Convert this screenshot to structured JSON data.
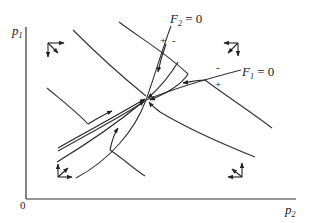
{
  "diagram": {
    "type": "phase-diagram",
    "axes": {
      "x_label": "p",
      "x_subscript": "2",
      "y_label": "p",
      "y_subscript": "1",
      "origin_label": "0"
    },
    "loci": [
      {
        "name": "F",
        "subscript": "2",
        "eq": " = 0",
        "plus": "+",
        "minus": "-"
      },
      {
        "name": "F",
        "subscript": "1",
        "eq": " = 0",
        "plus": "+",
        "minus": "-"
      }
    ],
    "colors": {
      "line": "#333333",
      "background": "#ffffff"
    }
  }
}
